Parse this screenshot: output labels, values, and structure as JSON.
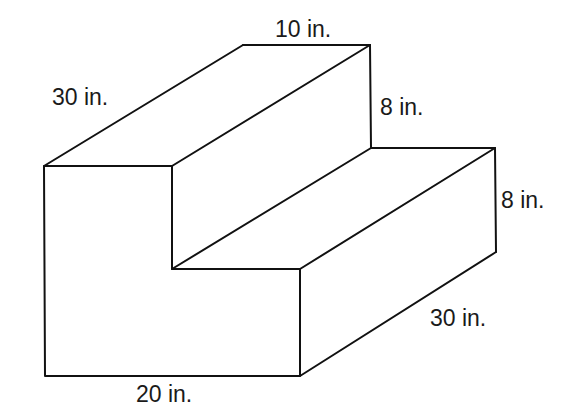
{
  "figure": {
    "labels": {
      "top_width": "10 in.",
      "left_depth": "30 in.",
      "upper_riser": "8 in.",
      "lower_riser": "8 in.",
      "right_depth": "30 in.",
      "bottom_width": "20 in."
    },
    "colors": {
      "stroke": "#111111",
      "background": "#ffffff",
      "text": "#1a1a1a"
    }
  }
}
